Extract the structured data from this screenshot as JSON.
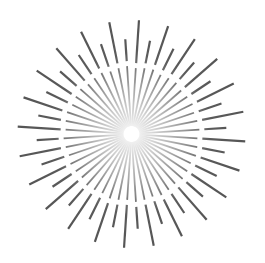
{
  "graphic": {
    "name": "sunburst",
    "center": [
      131.5,
      134
    ],
    "ray_count": 48,
    "angle_offset_deg": 3.75,
    "long_radius": 114,
    "short_radius": 95,
    "inner_radius": 8,
    "gap_start": 66,
    "gap_end": 71,
    "stroke_width": 2.2,
    "colors": {
      "ray": "#555555",
      "ray_center_fade": "#dddddd",
      "background": "#ffffff"
    }
  }
}
